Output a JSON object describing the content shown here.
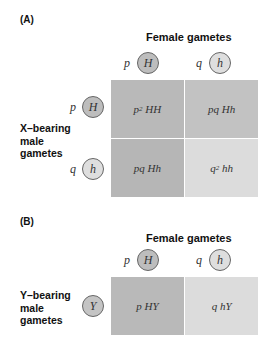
{
  "panel_a": {
    "label": "(A)",
    "column_header": "Female gametes",
    "columns": [
      {
        "freq": "p",
        "allele": "H",
        "fill": "#bdbdbd"
      },
      {
        "freq": "q",
        "allele": "h",
        "fill": "#dedede"
      }
    ],
    "row_header": "X–bearing\nmale\ngametes",
    "rows": [
      {
        "freq": "p",
        "allele": "H",
        "fill": "#bdbdbd"
      },
      {
        "freq": "q",
        "allele": "h",
        "fill": "#dedede"
      }
    ],
    "cells": [
      [
        {
          "coef": "p",
          "exp": "2",
          "genotype": "HH",
          "fill": "#b9b9b9"
        },
        {
          "coef": "pq",
          "exp": "",
          "genotype": "Hh",
          "fill": "#c2c2c2"
        }
      ],
      [
        {
          "coef": "pq",
          "exp": "",
          "genotype": "Hh",
          "fill": "#b6b6b6"
        },
        {
          "coef": "q",
          "exp": "2",
          "genotype": "hh",
          "fill": "#dcdcdc"
        }
      ]
    ]
  },
  "panel_b": {
    "label": "(B)",
    "column_header": "Female gametes",
    "columns": [
      {
        "freq": "p",
        "allele": "H",
        "fill": "#bdbdbd"
      },
      {
        "freq": "q",
        "allele": "h",
        "fill": "#dedede"
      }
    ],
    "row_header": "Y–bearing\nmale\ngametes",
    "rows": [
      {
        "freq": "",
        "allele": "Y",
        "fill": "#c4c4c4"
      }
    ],
    "cells": [
      [
        {
          "coef": "p",
          "exp": "",
          "genotype": "HY",
          "fill": "#b9b9b9"
        },
        {
          "coef": "q",
          "exp": "",
          "genotype": "hY",
          "fill": "#dcdcdc"
        }
      ]
    ]
  }
}
